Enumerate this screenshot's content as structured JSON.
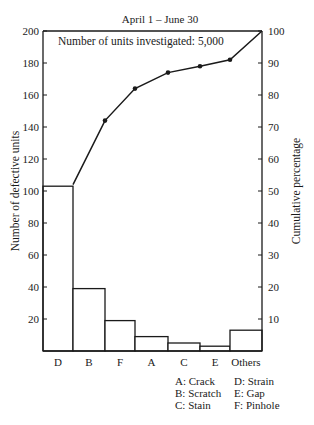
{
  "chart_data": {
    "type": "bar",
    "subtype": "pareto",
    "title": "April 1 – June 30",
    "annotation": "Number of units investigated: 5,000",
    "xlabel": "",
    "ylabel": "Number of defective units",
    "y2label": "Cumulative percentage",
    "categories": [
      "D",
      "B",
      "F",
      "A",
      "C",
      "E",
      "Others"
    ],
    "series": [
      {
        "name": "Number of defective units",
        "type": "bar",
        "values": [
          103,
          39,
          19,
          9,
          5,
          3,
          13
        ]
      },
      {
        "name": "Cumulative percentage",
        "type": "line",
        "axis": "right",
        "values": [
          52,
          72,
          82,
          87,
          89,
          91,
          100
        ]
      }
    ],
    "ylim": [
      0,
      200
    ],
    "y2lim": [
      0,
      100
    ],
    "yticks": [
      20,
      40,
      60,
      80,
      100,
      120,
      140,
      160,
      180,
      200
    ],
    "y2ticks": [
      10,
      20,
      30,
      40,
      50,
      60,
      70,
      80,
      90,
      100
    ],
    "grid": false,
    "legend": {
      "position": "bottom-right",
      "entries": [
        "A: Crack",
        "B: Scratch",
        "C: Stain",
        "D: Strain",
        "E: Gap",
        "F: Pinhole"
      ]
    }
  },
  "labels": {
    "title": "April 1 – June 30",
    "annotation": "Number of units investigated: 5,000",
    "ylabel": "Number of defective units",
    "y2label": "Cumulative percentage"
  }
}
